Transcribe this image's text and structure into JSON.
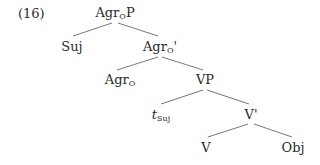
{
  "example_number": "(16)",
  "tree": {
    "nodes": [
      {
        "id": "agrop",
        "label": "Agr",
        "sub": "O",
        "suffix": "P",
        "x": 115,
        "y": 6
      },
      {
        "id": "suj",
        "label": "Suj",
        "sub": "",
        "suffix": "",
        "x": 72,
        "y": 40
      },
      {
        "id": "agrobar",
        "label": "Agr",
        "sub": "O",
        "suffix": "'",
        "x": 160,
        "y": 40
      },
      {
        "id": "agro",
        "label": "Agr",
        "sub": "O",
        "suffix": "",
        "x": 120,
        "y": 73
      },
      {
        "id": "vp",
        "label": "VP",
        "sub": "",
        "suffix": "",
        "x": 205,
        "y": 73
      },
      {
        "id": "tsuj",
        "label": "t",
        "sub": "Suj",
        "suffix": "",
        "x": 161,
        "y": 108
      },
      {
        "id": "vbar",
        "label": "V'",
        "sub": "",
        "suffix": "",
        "x": 251,
        "y": 108
      },
      {
        "id": "v",
        "label": "V",
        "sub": "",
        "suffix": "",
        "x": 206,
        "y": 141
      },
      {
        "id": "obj",
        "label": "Obj",
        "sub": "",
        "suffix": "",
        "x": 293,
        "y": 141
      }
    ],
    "edges": [
      [
        "agrop",
        "suj"
      ],
      [
        "agrop",
        "agrobar"
      ],
      [
        "agrobar",
        "agro"
      ],
      [
        "agrobar",
        "vp"
      ],
      [
        "vp",
        "tsuj"
      ],
      [
        "vp",
        "vbar"
      ],
      [
        "vbar",
        "v"
      ],
      [
        "vbar",
        "obj"
      ]
    ]
  }
}
